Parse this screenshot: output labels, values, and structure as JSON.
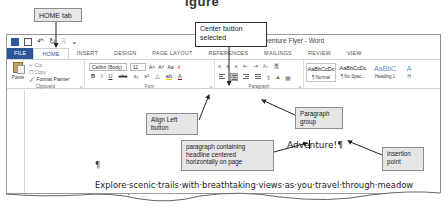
{
  "figure": {
    "heading_fragment": "igure"
  },
  "window": {
    "title": "Adventure Flyer - Word",
    "qat": [
      "word-icon",
      "save-icon",
      "undo-icon",
      "redo-icon",
      "touch-mode-icon",
      "customize-icon"
    ]
  },
  "tabs": [
    {
      "label": "FILE",
      "active": false
    },
    {
      "label": "HOME",
      "active": true
    },
    {
      "label": "INSERT",
      "active": false
    },
    {
      "label": "DESIGN",
      "active": false
    },
    {
      "label": "PAGE LAYOUT",
      "active": false
    },
    {
      "label": "REFERENCES",
      "active": false
    },
    {
      "label": "MAILINGS",
      "active": false
    },
    {
      "label": "REVIEW",
      "active": false
    },
    {
      "label": "VIEW",
      "active": false
    }
  ],
  "ribbon": {
    "clipboard": {
      "label": "Clipboard",
      "paste": "Paste",
      "cut": "Cut",
      "copy": "Copy",
      "format_painter": "Format Painter"
    },
    "font": {
      "label": "Font",
      "font_name": "Calibri (Body)",
      "font_size": "11",
      "grow": "A˄",
      "shrink": "A˅",
      "case": "Aa",
      "bold": "B",
      "italic": "I",
      "underline": "U",
      "strike": "abc",
      "subscript": "x₂",
      "superscript": "x²"
    },
    "paragraph": {
      "label": "Paragraph",
      "sort": "A↓",
      "show_marks": "¶"
    },
    "styles": {
      "items": [
        {
          "sample": "AaBbCcDc",
          "name": "¶ Normal",
          "selected": true
        },
        {
          "sample": "AaBbCcDc",
          "name": "¶ No Spac...",
          "selected": false
        },
        {
          "sample": "AaBbC",
          "name": "Heading 1",
          "selected": false
        },
        {
          "sample": "A",
          "name": "H",
          "selected": false
        }
      ]
    }
  },
  "document": {
    "headline": "Adventure!",
    "pilcrow": "¶",
    "empty_paragraph": "¶",
    "body_line1": "Explore·scenic·trails·with·breathtaking·views·as·you·travel·through·meadow",
    "body_line2_start": "mountai",
    "body_line2_end": "hicle.¶"
  },
  "callouts": {
    "home_tab": "HOME tab",
    "center_button": "Center button selected",
    "align_left": "Align Left button",
    "paragraph_group": "Paragraph group",
    "headline_para": "paragraph containing headline centered horizontally on page",
    "insertion_point": "insertion point"
  }
}
